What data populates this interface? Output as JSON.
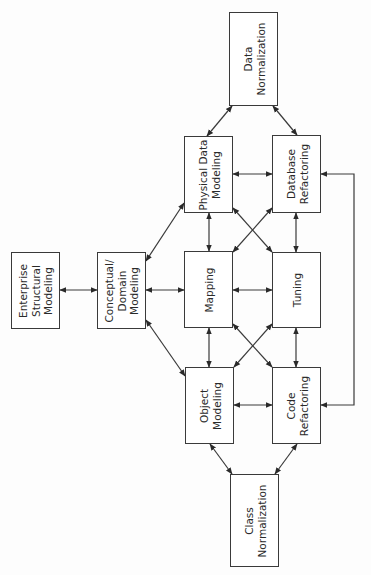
{
  "diagram": {
    "title": "",
    "line_color": "#3a3a3a",
    "nodes": [
      {
        "id": "data-normalization",
        "lines": [
          "Data",
          "Normalization"
        ],
        "x": 229,
        "y": 12,
        "w": 49,
        "h": 94
      },
      {
        "id": "enterprise-structural-modeling",
        "lines": [
          "Enterprise",
          "Structural",
          "Modeling"
        ],
        "x": 11,
        "y": 252,
        "w": 49,
        "h": 77
      },
      {
        "id": "conceptual-domain-modeling",
        "lines": [
          "Conceptual/",
          "Domain",
          "Modeling"
        ],
        "x": 97,
        "y": 252,
        "w": 49,
        "h": 77
      },
      {
        "id": "physical-data-modeling",
        "lines": [
          "Physical Data",
          "Modeling"
        ],
        "x": 184,
        "y": 136,
        "w": 49,
        "h": 77
      },
      {
        "id": "database-refactoring",
        "lines": [
          "Database",
          "Refactoring"
        ],
        "x": 272,
        "y": 135,
        "w": 49,
        "h": 78
      },
      {
        "id": "mapping",
        "lines": [
          "Mapping"
        ],
        "x": 184,
        "y": 251,
        "w": 49,
        "h": 77
      },
      {
        "id": "tuning",
        "lines": [
          "Tuning"
        ],
        "x": 272,
        "y": 252,
        "w": 49,
        "h": 76
      },
      {
        "id": "object-modeling",
        "lines": [
          "Object",
          "Modeling"
        ],
        "x": 185,
        "y": 367,
        "w": 49,
        "h": 77
      },
      {
        "id": "code-refactoring",
        "lines": [
          "Code",
          "Refactoring"
        ],
        "x": 272,
        "y": 367,
        "w": 49,
        "h": 77
      },
      {
        "id": "class-normalization",
        "lines": [
          "Class",
          "Normalization"
        ],
        "x": 230,
        "y": 474,
        "w": 49,
        "h": 93
      }
    ],
    "edges": [
      {
        "from": "data-normalization",
        "to": "physical-data-modeling",
        "points": [
          [
            232,
            106
          ],
          [
            207,
            136
          ]
        ],
        "bidirectional": true
      },
      {
        "from": "data-normalization",
        "to": "database-refactoring",
        "points": [
          [
            273,
            106
          ],
          [
            297,
            135
          ]
        ],
        "bidirectional": true
      },
      {
        "from": "enterprise-structural-modeling",
        "to": "conceptual-domain-modeling",
        "points": [
          [
            60,
            290
          ],
          [
            97,
            290
          ]
        ],
        "bidirectional": true
      },
      {
        "from": "conceptual-domain-modeling",
        "to": "physical-data-modeling",
        "points": [
          [
            146,
            261
          ],
          [
            184,
            203
          ]
        ],
        "bidirectional": true
      },
      {
        "from": "conceptual-domain-modeling",
        "to": "mapping",
        "points": [
          [
            146,
            290
          ],
          [
            184,
            290
          ]
        ],
        "bidirectional": true
      },
      {
        "from": "conceptual-domain-modeling",
        "to": "object-modeling",
        "points": [
          [
            146,
            320
          ],
          [
            185,
            376
          ]
        ],
        "bidirectional": true
      },
      {
        "from": "physical-data-modeling",
        "to": "database-refactoring",
        "points": [
          [
            233,
            174
          ],
          [
            272,
            174
          ]
        ],
        "bidirectional": true
      },
      {
        "from": "physical-data-modeling",
        "to": "mapping",
        "points": [
          [
            209,
            213
          ],
          [
            209,
            251
          ]
        ],
        "bidirectional": true
      },
      {
        "from": "database-refactoring",
        "to": "tuning",
        "points": [
          [
            296,
            213
          ],
          [
            296,
            252
          ]
        ],
        "bidirectional": true
      },
      {
        "from": "physical-data-modeling",
        "to": "tuning",
        "points": [
          [
            233,
            208
          ],
          [
            272,
            252
          ]
        ],
        "bidirectional": true
      },
      {
        "from": "mapping",
        "to": "database-refactoring",
        "points": [
          [
            233,
            252
          ],
          [
            272,
            208
          ]
        ],
        "bidirectional": true
      },
      {
        "from": "mapping",
        "to": "tuning",
        "points": [
          [
            233,
            290
          ],
          [
            272,
            290
          ]
        ],
        "bidirectional": true
      },
      {
        "from": "mapping",
        "to": "object-modeling",
        "points": [
          [
            209,
            328
          ],
          [
            209,
            367
          ]
        ],
        "bidirectional": true
      },
      {
        "from": "tuning",
        "to": "code-refactoring",
        "points": [
          [
            296,
            328
          ],
          [
            296,
            367
          ]
        ],
        "bidirectional": true
      },
      {
        "from": "mapping",
        "to": "code-refactoring",
        "points": [
          [
            233,
            324
          ],
          [
            272,
            367
          ]
        ],
        "bidirectional": true
      },
      {
        "from": "tuning",
        "to": "object-modeling",
        "points": [
          [
            272,
            324
          ],
          [
            234,
            367
          ]
        ],
        "bidirectional": true
      },
      {
        "from": "object-modeling",
        "to": "code-refactoring",
        "points": [
          [
            234,
            405
          ],
          [
            272,
            405
          ]
        ],
        "bidirectional": true
      },
      {
        "from": "code-refactoring",
        "to": "database-refactoring",
        "points": [
          [
            321,
            405
          ],
          [
            354,
            405
          ],
          [
            354,
            174
          ],
          [
            321,
            174
          ]
        ],
        "bidirectional": true
      },
      {
        "from": "object-modeling",
        "to": "class-normalization",
        "points": [
          [
            210,
            444
          ],
          [
            232,
            474
          ]
        ],
        "bidirectional": true
      },
      {
        "from": "code-refactoring",
        "to": "class-normalization",
        "points": [
          [
            297,
            444
          ],
          [
            275,
            474
          ]
        ],
        "bidirectional": true
      }
    ]
  }
}
